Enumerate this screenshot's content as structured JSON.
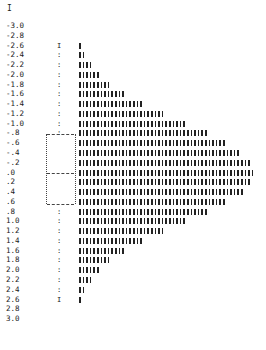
{
  "top_mark": "I",
  "chart_data": {
    "type": "bar",
    "orientation": "horizontal",
    "title": "",
    "xlabel": "",
    "ylabel": "",
    "categories": [
      "-3.0",
      "-2.8",
      "-2.6",
      "-2.4",
      "-2.2",
      "-2.0",
      "-1.8",
      "-1.6",
      "-1.4",
      "-1.2",
      "-1.0",
      "-.8",
      "-.6",
      "-.4",
      "-.2",
      ".0",
      ".2",
      ".4",
      ".6",
      ".8",
      "1.0",
      "1.2",
      "1.4",
      "1.6",
      "1.8",
      "2.0",
      "2.2",
      "2.4",
      "2.6",
      "2.8",
      "3.0"
    ],
    "values": [
      0,
      0,
      1,
      2,
      4,
      6,
      9,
      13,
      18,
      24,
      30,
      36,
      41,
      45,
      48,
      49,
      48,
      46,
      41,
      36,
      30,
      24,
      18,
      13,
      9,
      6,
      4,
      2,
      1,
      0,
      0
    ],
    "boxplot": {
      "whisker_low": -2.6,
      "whisker_high": 2.6,
      "q1": -0.7,
      "median": 0.0,
      "q3": 0.6
    },
    "grid": false,
    "legend": null
  }
}
